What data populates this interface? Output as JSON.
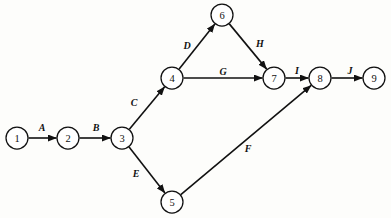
{
  "diagram": {
    "kind": "activity-network-diagram",
    "title": "",
    "canvas": {
      "width": 391,
      "height": 218,
      "background": "#fdfdfb"
    },
    "style": {
      "stroke": "#111111",
      "node_fill": "#ffffff",
      "node_radius": 11
    },
    "nodes": [
      {
        "id": "1",
        "label": "1",
        "x": 17,
        "y": 138
      },
      {
        "id": "2",
        "label": "2",
        "x": 68,
        "y": 138
      },
      {
        "id": "3",
        "label": "3",
        "x": 122,
        "y": 138
      },
      {
        "id": "4",
        "label": "4",
        "x": 172,
        "y": 78
      },
      {
        "id": "5",
        "label": "5",
        "x": 172,
        "y": 202
      },
      {
        "id": "6",
        "label": "6",
        "x": 222,
        "y": 15
      },
      {
        "id": "7",
        "label": "7",
        "x": 274,
        "y": 78
      },
      {
        "id": "8",
        "label": "8",
        "x": 320,
        "y": 78
      },
      {
        "id": "9",
        "label": "9",
        "x": 374,
        "y": 78
      }
    ],
    "edges": [
      {
        "id": "A",
        "label": "A",
        "from": "1",
        "to": "2",
        "label_x": 42,
        "label_y": 127
      },
      {
        "id": "B",
        "label": "B",
        "from": "2",
        "to": "3",
        "label_x": 96,
        "label_y": 127
      },
      {
        "id": "C",
        "label": "C",
        "from": "3",
        "to": "4",
        "label_x": 134,
        "label_y": 102
      },
      {
        "id": "D",
        "label": "D",
        "from": "4",
        "to": "6",
        "label_x": 187,
        "label_y": 45
      },
      {
        "id": "E",
        "label": "E",
        "from": "3",
        "to": "5",
        "label_x": 136,
        "label_y": 173
      },
      {
        "id": "F",
        "label": "F",
        "from": "5",
        "to": "8",
        "label_x": 248,
        "label_y": 148
      },
      {
        "id": "G",
        "label": "G",
        "from": "4",
        "to": "7",
        "label_x": 223,
        "label_y": 71
      },
      {
        "id": "H",
        "label": "H",
        "from": "6",
        "to": "7",
        "label_x": 260,
        "label_y": 43
      },
      {
        "id": "I",
        "label": "I",
        "from": "7",
        "to": "8",
        "label_x": 297,
        "label_y": 70
      },
      {
        "id": "J",
        "label": "J",
        "from": "8",
        "to": "9",
        "label_x": 350,
        "label_y": 70
      }
    ]
  }
}
